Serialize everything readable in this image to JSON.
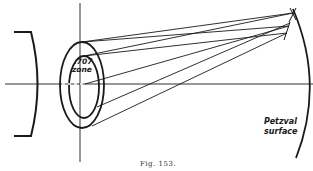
{
  "figure": {
    "caption": "Fig. 153.",
    "labels": {
      "zone_line1": ".707",
      "zone_line2": "zone",
      "surface_line1": "Petzval",
      "surface_line2": "surface"
    },
    "colors": {
      "ink": "#1a1a1a",
      "background": "#ffffff",
      "caption": "#333333"
    }
  }
}
